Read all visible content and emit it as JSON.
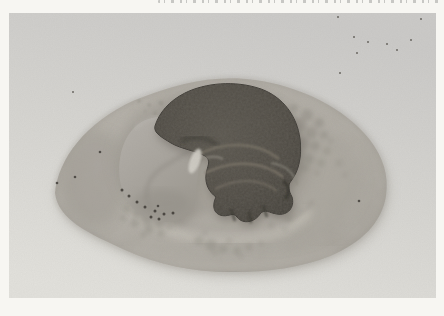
{
  "meta": {
    "kind": "black-and-white photographic plate",
    "caption_note": "A line of printed text is cropped at the very top edge; only the bottoms of the letters are visible and the text is illegible."
  },
  "palette": {
    "frame_white": "#f7f6f2",
    "backdrop_top": "#cbcac8",
    "backdrop_mid": "#d6d5d1",
    "backdrop_bottom": "#e2e1dc",
    "disc_light": "#bab6ae",
    "disc_mid": "#b0aca4",
    "disc_deep": "#a7a39b",
    "disc_edge": "#9c9890",
    "disc_rim_line": "#96928a",
    "disc_shadow": "#a9a69f",
    "crater": "#a09c94",
    "crater_wash": "#a6a29a",
    "floor_light": "#b3afa7",
    "rim_highlight": "#c5c1b8",
    "rim_shadow_line": "#938f87",
    "bottom_band": "#b8b4ac",
    "lobe_light": "#b3afa9",
    "lobe_dark": "#9c9890",
    "lobe_crease": "#8b8780",
    "lobe_highlight": "#bcb9b3",
    "lobe_shade": "#938f87",
    "embryo_core": "#5a564e",
    "embryo_mid": "#4e4a43",
    "embryo_edge": "#423f39",
    "embryo_outline": "#3d3a35",
    "embryo_shadow": "#6f6b63",
    "embryo_crease": "#33312c",
    "streak_light": "#7b7468",
    "streak_bright": "#8d8a80",
    "sliver": "#d2cfc7",
    "mottle": "#8f8b83",
    "speck_dark": "#3f3c37",
    "backdrop_speck": "#504d47"
  },
  "mottle": {
    "upper_right": [
      [
        272,
        100,
        5,
        0.5
      ],
      [
        285,
        95,
        4,
        0.45
      ],
      [
        298,
        102,
        6,
        0.5
      ],
      [
        310,
        110,
        5,
        0.5
      ],
      [
        290,
        112,
        7,
        0.55
      ],
      [
        302,
        120,
        6,
        0.5
      ],
      [
        315,
        122,
        4,
        0.45
      ],
      [
        280,
        122,
        5,
        0.5
      ],
      [
        294,
        130,
        6,
        0.55
      ],
      [
        306,
        133,
        5,
        0.5
      ],
      [
        318,
        138,
        4,
        0.4
      ],
      [
        288,
        140,
        5,
        0.5
      ],
      [
        300,
        146,
        5,
        0.45
      ],
      [
        312,
        150,
        4,
        0.4
      ],
      [
        322,
        128,
        3,
        0.35
      ],
      [
        270,
        110,
        4,
        0.4
      ],
      [
        278,
        132,
        4,
        0.45
      ],
      [
        296,
        155,
        4,
        0.4
      ],
      [
        308,
        160,
        3,
        0.35
      ],
      [
        265,
        92,
        3,
        0.4
      ],
      [
        330,
        150,
        4,
        0.3
      ],
      [
        336,
        162,
        3,
        0.3
      ]
    ],
    "lower_left": [
      [
        118,
        196,
        4,
        0.4
      ],
      [
        128,
        200,
        5,
        0.45
      ],
      [
        138,
        206,
        6,
        0.5
      ],
      [
        150,
        210,
        5,
        0.5
      ],
      [
        126,
        210,
        4,
        0.45
      ],
      [
        140,
        216,
        5,
        0.45
      ],
      [
        152,
        220,
        4,
        0.4
      ],
      [
        114,
        205,
        3,
        0.4
      ],
      [
        160,
        214,
        3,
        0.35
      ],
      [
        134,
        222,
        3,
        0.4
      ]
    ],
    "bottom_center": [
      [
        190,
        228,
        5,
        0.4
      ],
      [
        202,
        232,
        6,
        0.45
      ],
      [
        214,
        236,
        5,
        0.4
      ],
      [
        228,
        238,
        4,
        0.4
      ],
      [
        240,
        234,
        4,
        0.35
      ],
      [
        252,
        230,
        3,
        0.3
      ],
      [
        220,
        228,
        3,
        0.35
      ],
      [
        206,
        240,
        3,
        0.35
      ],
      [
        196,
        220,
        3,
        0.3
      ],
      [
        232,
        244,
        3,
        0.3
      ]
    ],
    "floor_right": [
      [
        268,
        200,
        5,
        0.3
      ],
      [
        280,
        206,
        4,
        0.3
      ],
      [
        290,
        196,
        3,
        0.25
      ],
      [
        262,
        212,
        4,
        0.3
      ],
      [
        276,
        216,
        3,
        0.25
      ]
    ],
    "top_left": [
      [
        130,
        88,
        2,
        0.4
      ],
      [
        140,
        92,
        2,
        0.4
      ],
      [
        152,
        90,
        2.5,
        0.45
      ],
      [
        163,
        95,
        2,
        0.4
      ],
      [
        172,
        90,
        2,
        0.35
      ],
      [
        146,
        100,
        2,
        0.4
      ],
      [
        136,
        98,
        1.5,
        0.35
      ],
      [
        158,
        102,
        1.5,
        0.35
      ]
    ]
  },
  "lobe_speckles": [
    [
      113,
      177
    ],
    [
      120,
      183
    ],
    [
      128,
      189
    ],
    [
      136,
      194
    ],
    [
      146,
      198
    ],
    [
      155,
      201
    ],
    [
      164,
      200
    ],
    [
      150,
      206
    ],
    [
      142,
      204
    ]
  ],
  "disc_specks": [
    [
      350,
      188
    ],
    [
      66,
      164
    ],
    [
      91,
      139
    ],
    [
      149,
      193
    ],
    [
      48,
      170
    ]
  ],
  "backdrop_specks": [
    [
      329,
      4
    ],
    [
      345,
      24
    ],
    [
      359,
      29
    ],
    [
      378,
      31
    ],
    [
      388,
      37
    ],
    [
      348,
      40
    ],
    [
      331,
      60
    ],
    [
      402,
      27
    ],
    [
      412,
      6
    ],
    [
      64,
      79
    ],
    [
      428,
      253
    ]
  ]
}
